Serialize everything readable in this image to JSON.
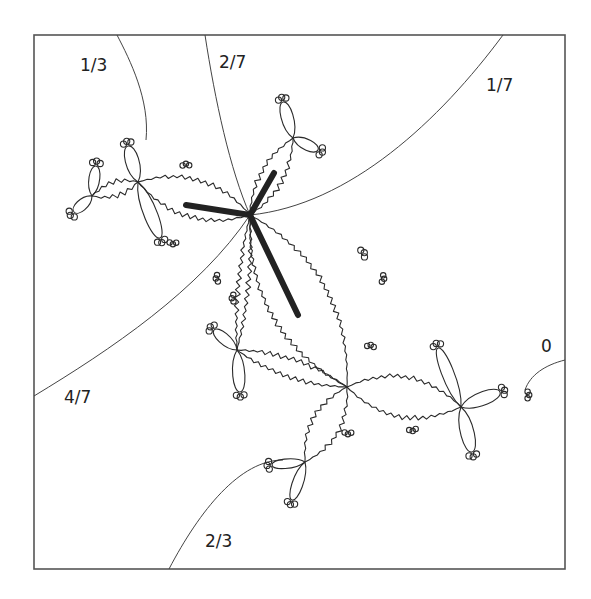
{
  "figure": {
    "frame": {
      "x": 34,
      "y": 35,
      "width": 531,
      "height": 534,
      "stroke": "#555555"
    },
    "colors": {
      "background": "#ffffff",
      "julia": "#2a2a2a",
      "ray": "#444444",
      "spider": "#222222"
    }
  },
  "ray_labels": [
    {
      "id": "ray-1-3",
      "text": "1/3",
      "x": 80,
      "y": 71
    },
    {
      "id": "ray-2-7",
      "text": "2/7",
      "x": 219,
      "y": 68
    },
    {
      "id": "ray-1-7",
      "text": "1/7",
      "x": 486,
      "y": 91
    },
    {
      "id": "ray-4-7",
      "text": "4/7",
      "x": 64,
      "y": 403
    },
    {
      "id": "ray-2-3",
      "text": "2/3",
      "x": 205,
      "y": 547
    },
    {
      "id": "ray-0",
      "text": "0",
      "x": 541,
      "y": 352
    }
  ],
  "rays": [
    {
      "angle": "1/3",
      "path": "M117,35 C130,60 150,100 146,140"
    },
    {
      "angle": "2/7",
      "path": "M205,35 C215,100 230,170 250,215"
    },
    {
      "angle": "1/7",
      "path": "M503,35 C440,120 350,205 250,215"
    },
    {
      "angle": "4/7",
      "path": "M34,396 C110,350 200,290 250,215"
    },
    {
      "angle": "2/3",
      "path": "M169,569 C200,510 240,460 283,460"
    },
    {
      "angle": "0",
      "path": "M565,360 C545,365 530,375 525,390"
    }
  ],
  "spider": {
    "hub": [
      250,
      215
    ],
    "legs": [
      [
        186,
        205
      ],
      [
        274,
        173
      ],
      [
        298,
        315
      ]
    ]
  },
  "julia_hubs": [
    {
      "name": "alpha",
      "x": 250,
      "y": 215
    },
    {
      "name": "lower-center",
      "x": 347,
      "y": 387
    },
    {
      "name": "right",
      "x": 461,
      "y": 407
    },
    {
      "name": "upper-right",
      "x": 293,
      "y": 138
    },
    {
      "name": "left-lobe",
      "x": 138,
      "y": 182
    },
    {
      "name": "far-left",
      "x": 92,
      "y": 196
    },
    {
      "name": "lower-left",
      "x": 237,
      "y": 350
    },
    {
      "name": "bottom",
      "x": 305,
      "y": 462
    }
  ]
}
